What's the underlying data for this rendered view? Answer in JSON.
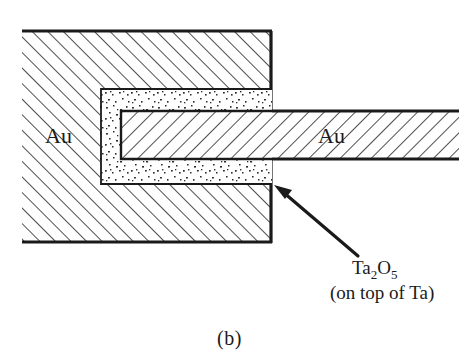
{
  "figure": {
    "caption": "(b)",
    "regions": {
      "substrate_label": "Au",
      "arm_label": "Au",
      "oxide_label_main": "Ta",
      "oxide_label_sub1": "2",
      "oxide_label_mid": "O",
      "oxide_label_sub2": "5",
      "oxide_label_note": "(on top of Ta)"
    },
    "colors": {
      "line": "#1a1a1a",
      "fill": "#ffffff",
      "hatch": "#333333",
      "speckle": "#2b2b2b",
      "background": "#ffffff"
    },
    "geometry": {
      "substrate": {
        "x": 22,
        "y": 30,
        "width": 250,
        "height": 213
      },
      "arm": {
        "x": 272,
        "y": 110,
        "width": 187,
        "height": 50
      },
      "oxide_outer": {
        "x": 100,
        "y": 88,
        "width": 172,
        "height": 97
      },
      "channel": {
        "x": 120,
        "y": 110,
        "width": 152,
        "height": 50
      },
      "arrow": {
        "x1": 358,
        "y1": 256,
        "x2": 276,
        "y2": 186
      }
    }
  }
}
